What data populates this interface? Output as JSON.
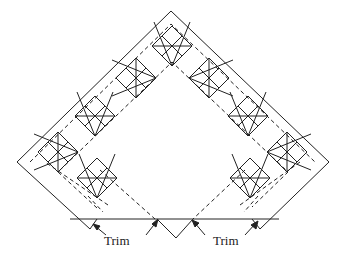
{
  "diagram": {
    "type": "quilt-border-layout",
    "labels": {
      "trim_left": "Trim",
      "trim_right": "Trim"
    },
    "colors": {
      "line": "#222222",
      "background": "#ffffff"
    }
  }
}
